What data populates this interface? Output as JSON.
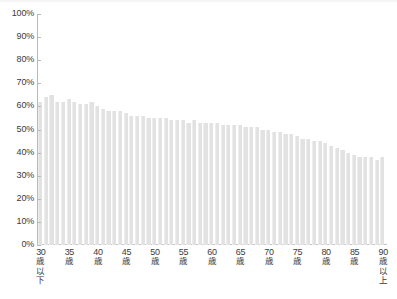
{
  "chart_data": {
    "type": "bar",
    "title": "",
    "subtitle": "",
    "xlabel": "",
    "ylabel": "",
    "ylim": [
      0,
      100
    ],
    "y_unit": "%",
    "grid": false,
    "legend": null,
    "y_ticks": [
      {
        "value": 100,
        "label": "100%"
      },
      {
        "value": 90,
        "label": "90%"
      },
      {
        "value": 80,
        "label": "80%"
      },
      {
        "value": 70,
        "label": "70%"
      },
      {
        "value": 60,
        "label": "60%"
      },
      {
        "value": 50,
        "label": "50%"
      },
      {
        "value": 40,
        "label": "40%"
      },
      {
        "value": 30,
        "label": "30%"
      },
      {
        "value": 20,
        "label": "20%"
      },
      {
        "value": 10,
        "label": "10%"
      },
      {
        "value": 0,
        "label": "0%"
      }
    ],
    "x_tick_labels": [
      {
        "index": 0,
        "num": "30",
        "jp": "歳以下",
        "label": "30歳以下"
      },
      {
        "index": 5,
        "num": "35",
        "jp": "歳",
        "label": "35歳"
      },
      {
        "index": 10,
        "num": "40",
        "jp": "歳",
        "label": "40歳"
      },
      {
        "index": 15,
        "num": "45",
        "jp": "歳",
        "label": "45歳"
      },
      {
        "index": 20,
        "num": "50",
        "jp": "歳",
        "label": "50歳"
      },
      {
        "index": 25,
        "num": "55",
        "jp": "歳",
        "label": "55歳"
      },
      {
        "index": 30,
        "num": "60",
        "jp": "歳",
        "label": "60歳"
      },
      {
        "index": 35,
        "num": "65",
        "jp": "歳",
        "label": "65歳"
      },
      {
        "index": 40,
        "num": "70",
        "jp": "歳",
        "label": "70歳"
      },
      {
        "index": 45,
        "num": "75",
        "jp": "歳",
        "label": "75歳"
      },
      {
        "index": 50,
        "num": "80",
        "jp": "歳",
        "label": "80歳"
      },
      {
        "index": 55,
        "num": "85",
        "jp": "歳",
        "label": "85歳"
      },
      {
        "index": 60,
        "num": "90",
        "jp": "歳以上",
        "label": "90歳以上"
      }
    ],
    "categories": [
      "30歳以下",
      "31歳",
      "32歳",
      "33歳",
      "34歳",
      "35歳",
      "36歳",
      "37歳",
      "38歳",
      "39歳",
      "40歳",
      "41歳",
      "42歳",
      "43歳",
      "44歳",
      "45歳",
      "46歳",
      "47歳",
      "48歳",
      "49歳",
      "50歳",
      "51歳",
      "52歳",
      "53歳",
      "54歳",
      "55歳",
      "56歳",
      "57歳",
      "58歳",
      "59歳",
      "60歳",
      "61歳",
      "62歳",
      "63歳",
      "64歳",
      "65歳",
      "66歳",
      "67歳",
      "68歳",
      "69歳",
      "70歳",
      "71歳",
      "72歳",
      "73歳",
      "74歳",
      "75歳",
      "76歳",
      "77歳",
      "78歳",
      "79歳",
      "80歳",
      "81歳",
      "82歳",
      "83歳",
      "84歳",
      "85歳",
      "86歳",
      "87歳",
      "88歳",
      "89歳",
      "90歳以上"
    ],
    "values": [
      62,
      64,
      65,
      62,
      62,
      63,
      62,
      61,
      61,
      62,
      60,
      59,
      58,
      58,
      58,
      57,
      56,
      56,
      56,
      55,
      55,
      55,
      55,
      54,
      54,
      54,
      53,
      54,
      53,
      53,
      53,
      53,
      52,
      52,
      52,
      52,
      51,
      51,
      51,
      50,
      50,
      49,
      49,
      48,
      48,
      47,
      46,
      46,
      45,
      45,
      44,
      43,
      42,
      41,
      40,
      39,
      38,
      38,
      38,
      37,
      38
    ],
    "colors": {
      "bar": "#e2e2e2",
      "bar_edge": "#ededed",
      "axis": "#b9b9b9",
      "text": "#3b3b3b",
      "background": "#ffffff"
    }
  }
}
